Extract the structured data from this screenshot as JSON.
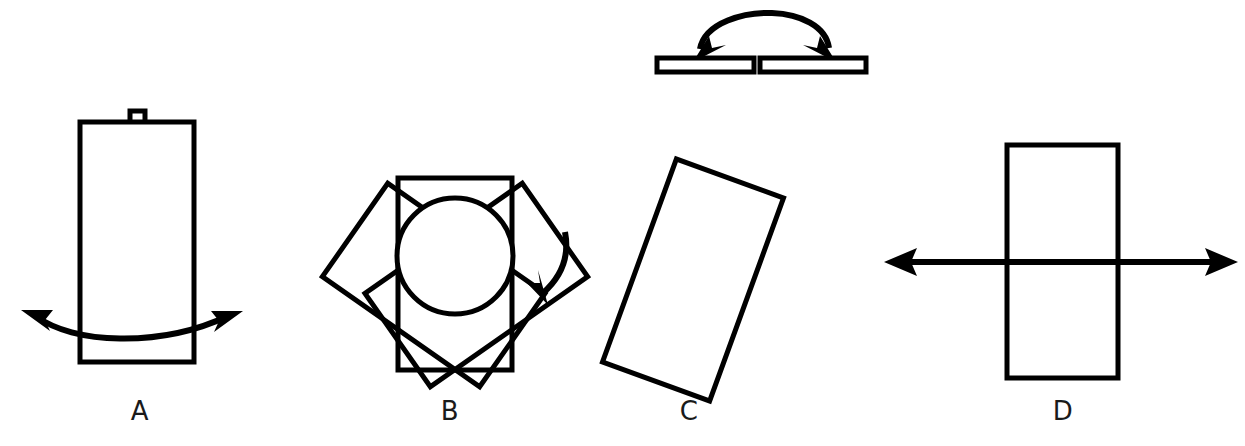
{
  "figure": {
    "title": "",
    "background_color": "#ffffff",
    "ink_color": "#000000",
    "width": 1245,
    "height": 446,
    "panels": [
      {
        "id": "top",
        "label": "",
        "shape": "split-bar-with-arc-arrow",
        "motion": "fold-down-both-ends",
        "elements": [
          "left-bar-segment",
          "right-bar-segment",
          "arc-double-arrow"
        ]
      },
      {
        "id": "a",
        "label": "A",
        "shape": "tall-rectangle-with-knob",
        "motion": "swing-left-right",
        "elements": [
          "rectangle",
          "top-knob",
          "curved-double-arrow"
        ]
      },
      {
        "id": "b",
        "label": "B",
        "shape": "rectangle-with-circle-and-rotated-copies",
        "motion": "rotate-about-circle",
        "elements": [
          "rectangle",
          "circle",
          "rotated-copy-left",
          "rotated-copy-right",
          "curved-arrow"
        ]
      },
      {
        "id": "c",
        "label": "C",
        "shape": "tilted-rectangle",
        "motion": "none",
        "elements": [
          "rectangle"
        ]
      },
      {
        "id": "d",
        "label": "D",
        "shape": "rectangle-with-horizontal-axis-arrow",
        "motion": "translate-left-right",
        "elements": [
          "rectangle",
          "horizontal-double-arrow"
        ]
      }
    ],
    "labels": {
      "a": "A",
      "b": "B",
      "c": "C",
      "d": "D"
    }
  }
}
